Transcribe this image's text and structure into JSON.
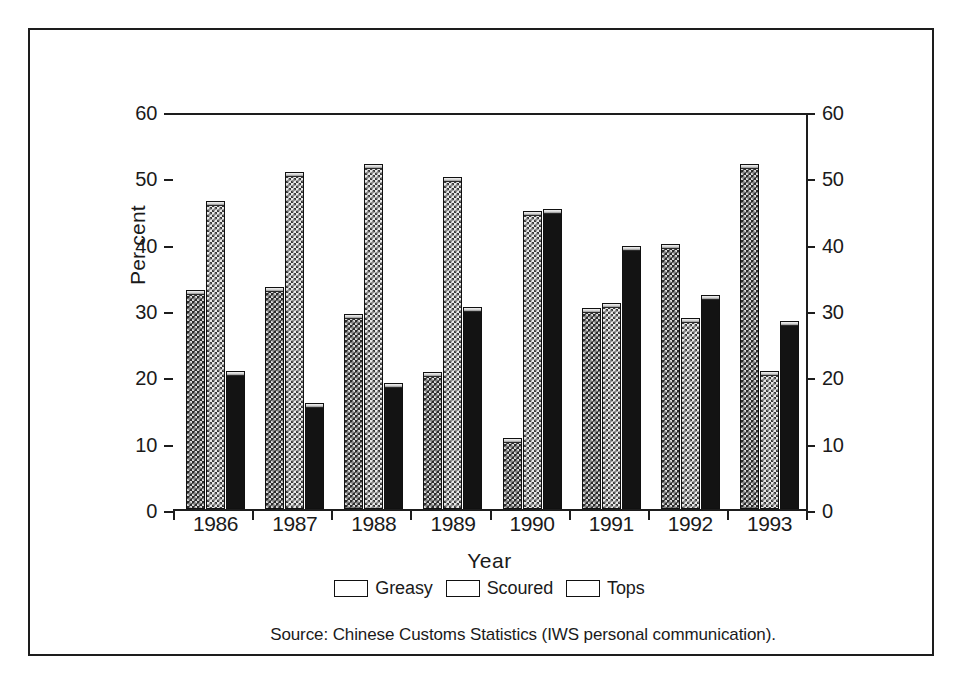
{
  "chart_data": {
    "type": "bar",
    "title": "",
    "xlabel": "Year",
    "ylabel": "Per cent",
    "categories": [
      "1986",
      "1987",
      "1988",
      "1989",
      "1990",
      "1991",
      "1992",
      "1993"
    ],
    "series": [
      {
        "name": "Greasy",
        "values": [
          33.0,
          33.5,
          29.4,
          20.6,
          10.7,
          30.3,
          40.0,
          52.0
        ]
      },
      {
        "name": "Scoured",
        "values": [
          46.5,
          50.8,
          52.0,
          50.0,
          45.0,
          31.0,
          28.8,
          20.8
        ]
      },
      {
        "name": "Tops",
        "values": [
          20.8,
          16.0,
          19.0,
          30.4,
          45.2,
          39.7,
          32.2,
          28.4
        ]
      }
    ],
    "ylim": [
      0,
      60
    ],
    "yticks": [
      0,
      10,
      20,
      30,
      40,
      50,
      60
    ],
    "ytick_labels_left": [
      "0",
      "10",
      "20",
      "30",
      "40",
      "50",
      "60"
    ],
    "ytick_labels_right": [
      "0",
      "10",
      "20",
      "30",
      "40",
      "50",
      "60"
    ],
    "grid": false,
    "legend_position": "bottom-center",
    "dual_y_axis": true
  },
  "legend": {
    "items": [
      {
        "label": "Greasy",
        "pattern": "dark-checker"
      },
      {
        "label": "Scoured",
        "pattern": "light-checker"
      },
      {
        "label": "Tops",
        "pattern": "solid-black"
      }
    ]
  },
  "source": {
    "text": "Source: Chinese Customs Statistics (IWS personal communication)."
  }
}
